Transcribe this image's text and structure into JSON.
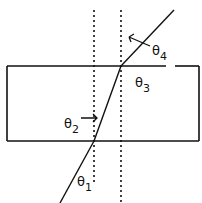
{
  "diagram": {
    "colors": {
      "stroke": "#111111",
      "background": "#ffffff"
    },
    "slab": {
      "x": 7,
      "y": 66,
      "width": 192,
      "height": 75,
      "top_gap": [
        166,
        175
      ]
    },
    "normals": [
      {
        "x": 94,
        "y1": 10,
        "y2": 182
      },
      {
        "x": 121,
        "y1": 10,
        "y2": 203
      }
    ],
    "ray": {
      "incident": {
        "x1": 60,
        "y1": 203,
        "x2": 94,
        "y2": 141
      },
      "internal": {
        "x1": 94,
        "y1": 141,
        "x2": 121,
        "y2": 66
      },
      "emergent": {
        "x1": 121,
        "y1": 66,
        "x2": 174,
        "y2": 10
      }
    },
    "labels": {
      "theta1": {
        "base": "θ",
        "sub": "1"
      },
      "theta2": {
        "base": "θ",
        "sub": "2"
      },
      "theta3": {
        "base": "θ",
        "sub": "3"
      },
      "theta4": {
        "base": "θ",
        "sub": "4"
      }
    }
  }
}
